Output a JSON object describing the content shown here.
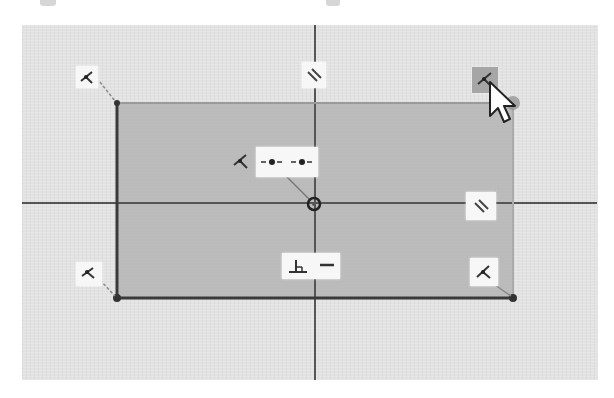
{
  "viewport": {
    "type": "sketch-canvas",
    "background": "#e2e2e2",
    "sketch_fill": "#b4b4b4",
    "line_color": "#3a3a3a",
    "axis_color": "#555555"
  },
  "axes": {
    "horizontal_label": "horizontal axis",
    "vertical_label": "vertical axis",
    "origin_label": "origin point"
  },
  "sketch": {
    "shape": "rectangle",
    "corners": [
      {
        "name": "top-left",
        "x": 117,
        "y": 103
      },
      {
        "name": "top-right",
        "x": 513,
        "y": 103
      },
      {
        "name": "bottom-right",
        "x": 513,
        "y": 298
      },
      {
        "name": "bottom-left",
        "x": 117,
        "y": 298
      }
    ]
  },
  "constraints": [
    {
      "id": "coincident-top-left",
      "icon": "coincident-icon",
      "label": "Coincident"
    },
    {
      "id": "parallel-top",
      "icon": "parallel-icon",
      "label": "Parallel"
    },
    {
      "id": "coincident-top-right",
      "icon": "coincident-icon",
      "label": "Coincident",
      "state": "hovered"
    },
    {
      "id": "coincident-center",
      "icon": "coincident-icon",
      "label": "Coincident"
    },
    {
      "id": "midpoint-center",
      "icon": "midpoint-icon",
      "label": "Midpoint"
    },
    {
      "id": "parallel-right",
      "icon": "parallel-icon",
      "label": "Parallel"
    },
    {
      "id": "perpendicular-bottom",
      "icon": "perpendicular-icon",
      "label": "Perpendicular"
    },
    {
      "id": "horizontal-bottom",
      "icon": "horizontal-icon",
      "label": "Horizontal"
    },
    {
      "id": "coincident-bottom-left",
      "icon": "coincident-icon",
      "label": "Coincident"
    },
    {
      "id": "coincident-bottom-right",
      "icon": "coincident-icon",
      "label": "Coincident"
    }
  ],
  "cursor": {
    "icon": "mouse-pointer-icon",
    "x": 490,
    "y": 82
  }
}
